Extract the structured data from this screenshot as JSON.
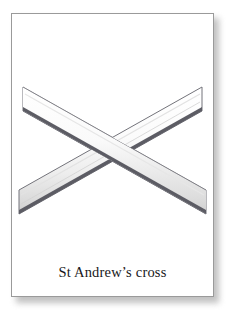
{
  "card": {
    "background_color": "#ffffff",
    "border_color": "#9a9a9a",
    "shadow_color": "#8e8e8e"
  },
  "illustration": {
    "name": "saltire-diagonal-cross-drawing",
    "description": "Line drawing of a saltire: two flat beams crossing diagonally to form an X",
    "beam_fill_color": "#fbfbfb",
    "beam_shade_color": "#d8d8d8",
    "beam_outline_color": "#6f6f75",
    "beam_dark_edge_color": "#4a4a52",
    "beams": [
      {
        "name": "beam-top-left-to-bottom-right",
        "start": [
          22,
          86
        ],
        "end": [
          205,
          213
        ]
      },
      {
        "name": "beam-top-right-to-bottom-left",
        "start": [
          205,
          86
        ],
        "end": [
          22,
          213
        ]
      }
    ],
    "center_point": [
      113,
      149
    ]
  },
  "caption": {
    "text": "St Andrew’s cross",
    "color": "#18181a"
  }
}
